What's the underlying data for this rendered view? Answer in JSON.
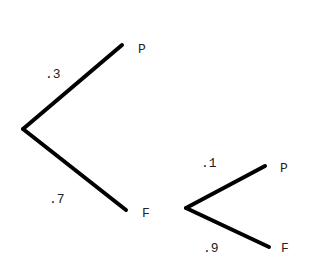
{
  "diagram": {
    "type": "probability-tree",
    "line_color": "#000000",
    "text_color": "#222222",
    "branches": [
      {
        "id": "root-upper",
        "probability": ".3",
        "outcome": "P"
      },
      {
        "id": "root-lower",
        "probability": ".7",
        "outcome": "F"
      },
      {
        "id": "f-upper",
        "probability": ".1",
        "outcome": "P"
      },
      {
        "id": "f-lower",
        "probability": ".9",
        "outcome": "F"
      }
    ]
  }
}
